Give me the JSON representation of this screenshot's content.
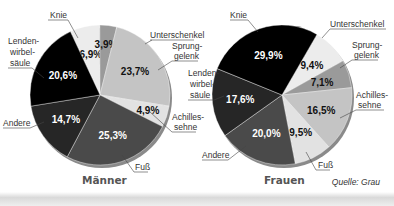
{
  "chart_data": [
    {
      "type": "pie",
      "title": "Männer",
      "start_angle_deg": -25,
      "direction": "clockwise",
      "categories": [
        "Unterschenkel",
        "Sprunggelenk",
        "Achillessehne",
        "Fuß",
        "Andere",
        "Lendenwirbelsäule",
        "Knie"
      ],
      "values": [
        6.9,
        3.9,
        23.7,
        4.9,
        25.3,
        14.7,
        20.6
      ],
      "value_labels": [
        "6,9%",
        "3,9%",
        "23,7%",
        "4,9%",
        "25,3%",
        "14,7%",
        "20,6%"
      ],
      "colors": [
        "#ececec",
        "#9a9a9a",
        "#c4c4c4",
        "#e2e2e2",
        "#4a4a4a",
        "#262626",
        "#000000"
      ],
      "label_colors": [
        "#111111",
        "#111111",
        "#111111",
        "#111111",
        "#ffffff",
        "#ffffff",
        "#ffffff"
      ]
    },
    {
      "type": "pie",
      "title": "Frauen",
      "start_angle_deg": 30,
      "direction": "clockwise",
      "categories": [
        "Unterschenkel",
        "Sprunggelenk",
        "Achillessehne",
        "Fuß",
        "Andere",
        "Lendenwirbelsäule",
        "Knie"
      ],
      "values": [
        9.4,
        7.1,
        16.5,
        9.5,
        20.0,
        17.6,
        29.9
      ],
      "value_labels": [
        "9,4%",
        "7,1%",
        "16,5%",
        "9,5%",
        "20,0%",
        "17,6%",
        "29,9%"
      ],
      "colors": [
        "#ececec",
        "#9a9a9a",
        "#c4c4c4",
        "#e2e2e2",
        "#4a4a4a",
        "#262626",
        "#000000"
      ],
      "label_colors": [
        "#111111",
        "#111111",
        "#111111",
        "#111111",
        "#ffffff",
        "#ffffff",
        "#ffffff"
      ]
    }
  ],
  "charts": {
    "left_title": "Männer",
    "right_title": "Frauen"
  },
  "labels": {
    "knie": "Knie",
    "unterschenkel": "Unterschenkel",
    "sprung_1": "Sprung-",
    "sprung_2": "gelenk",
    "lenden_1": "Lenden-",
    "lenden_2": "wirbel-",
    "lenden_3": "säule",
    "andere": "Andere",
    "achilles_1": "Achilles-",
    "achilles_2": "sehne",
    "fuss": "Fuß"
  },
  "source": "Quelle: Grau"
}
